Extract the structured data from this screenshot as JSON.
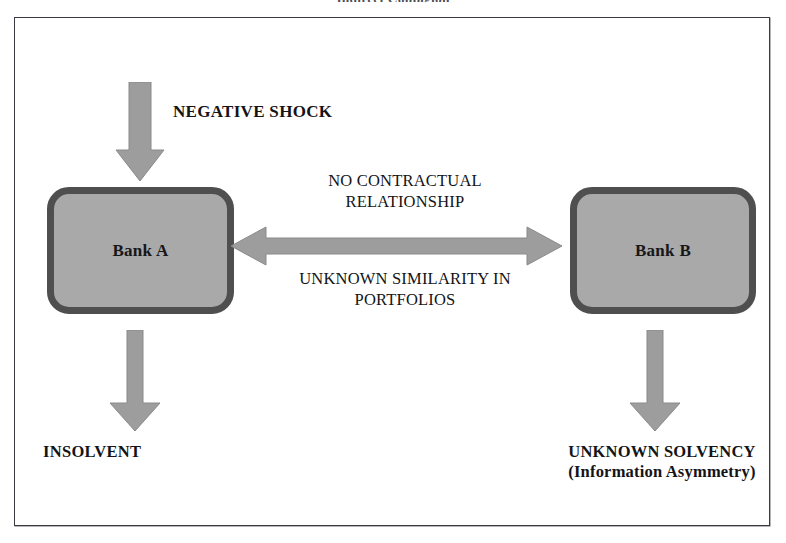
{
  "figure": {
    "caption": "Indirect Contagion"
  },
  "diagram": {
    "nodes": [
      {
        "id": "bank-a",
        "label": "Bank A"
      },
      {
        "id": "bank-b",
        "label": "Bank B"
      }
    ],
    "annotations": {
      "negative_shock": "NEGATIVE SHOCK",
      "no_contractual_relationship": "NO CONTRACTUAL\nRELATIONSHIP",
      "unknown_similarity": "UNKNOWN SIMILARITY IN\nPORTFOLIOS",
      "insolvent": "INSOLVENT",
      "unknown_solvency": "UNKNOWN SOLVENCY\n(Information Asymmetry)"
    },
    "arrows": [
      {
        "id": "arrow-shock",
        "name": "shock-into-bank-a",
        "direction": "down"
      },
      {
        "id": "arrow-between",
        "name": "bank-a-to-bank-b",
        "direction": "bidirectional"
      },
      {
        "id": "arrow-insolvent",
        "name": "bank-a-to-insolvent",
        "direction": "down"
      },
      {
        "id": "arrow-unknown",
        "name": "bank-b-to-unknown",
        "direction": "down"
      }
    ],
    "colors": {
      "arrow_fill": "#9d9d9d",
      "box_fill": "#a9a9a9",
      "box_border": "#4f4f4f",
      "frame_border": "#3a3a40",
      "text": "#141417",
      "background": "#ffffff"
    }
  }
}
